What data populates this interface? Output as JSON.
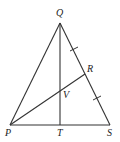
{
  "diagram": {
    "type": "geometry-triangle",
    "points": {
      "P": {
        "label": "P",
        "x": 10,
        "y": 125
      },
      "Q": {
        "label": "Q",
        "x": 60,
        "y": 23
      },
      "S": {
        "label": "S",
        "x": 110,
        "y": 125
      },
      "T": {
        "label": "T",
        "x": 60,
        "y": 125
      },
      "R": {
        "label": "R",
        "x": 85,
        "y": 74
      },
      "V": {
        "label": "V",
        "x": 60,
        "y": 91
      }
    },
    "segments": [
      "PQ",
      "QS",
      "PS",
      "QT",
      "PR"
    ],
    "congruence_marks": [
      "QR",
      "RS"
    ],
    "colors": {
      "line": "#333333",
      "background": "#ffffff"
    }
  }
}
